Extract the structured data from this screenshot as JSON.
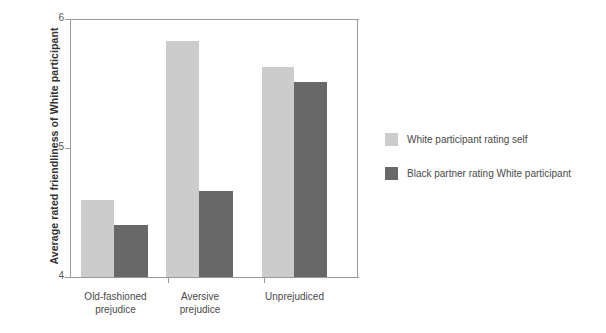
{
  "chart_data": {
    "type": "bar",
    "title": "",
    "subtitle": "",
    "xlabel": "",
    "ylabel": "Average rated friendliness of White participant",
    "ylim": [
      4,
      6
    ],
    "yticks": [
      "4",
      "5",
      "6"
    ],
    "grid": false,
    "legend_position": "right",
    "categories": [
      "Old-fashioned\nprejudice",
      "Aversive\nprejudice",
      "Unprejudiced"
    ],
    "series": [
      {
        "name": "White participant rating self",
        "color": "#cccccc",
        "values": [
          4.6,
          5.83,
          5.63
        ]
      },
      {
        "name": "Black partner rating White participant",
        "color": "#686868",
        "values": [
          4.4,
          4.67,
          5.51
        ]
      }
    ]
  },
  "legend": {
    "items": [
      {
        "label": "White participant rating self",
        "color": "#cccccc"
      },
      {
        "label": "Black partner rating White participant",
        "color": "#686868"
      }
    ]
  },
  "axis": {
    "y_title": "Average rated friendliness of White participant",
    "y_ticks": [
      "6",
      "5",
      "4"
    ]
  }
}
